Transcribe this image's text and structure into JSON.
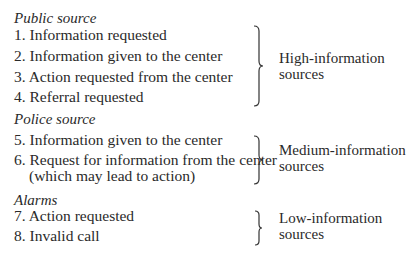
{
  "groups": [
    {
      "heading": "Public source",
      "items": [
        "1. Information requested",
        "2. Information given to the center",
        "3. Action requested from the center",
        "4. Referral requested"
      ],
      "label_line1": "High-information",
      "label_line2": "sources"
    },
    {
      "heading": "Police source",
      "items": [
        "5. Information given to the center",
        "6. Request for information from the center",
        "(which may lead to action)"
      ],
      "label_line1": "Medium-information",
      "label_line2": "sources"
    },
    {
      "heading": "Alarms",
      "items": [
        "7. Action requested",
        "8. Invalid call"
      ],
      "label_line1": "Low-information",
      "label_line2": "sources"
    }
  ]
}
